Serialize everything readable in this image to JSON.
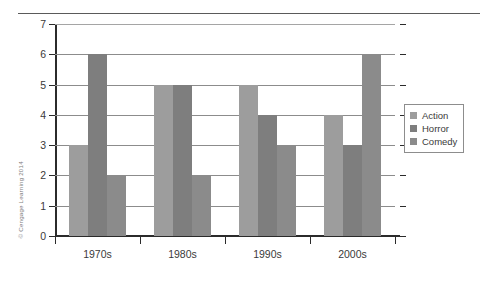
{
  "figure": {
    "credit": "© Cengage Learning 2014"
  },
  "chart_data": {
    "type": "bar",
    "title": "",
    "xlabel": "",
    "ylabel": "",
    "categories": [
      "1970s",
      "1980s",
      "1990s",
      "2000s"
    ],
    "series": [
      {
        "name": "Action",
        "color": "#9d9d9d",
        "values": [
          3,
          5,
          5,
          4
        ]
      },
      {
        "name": "Horror",
        "color": "#7e7e7e",
        "values": [
          6,
          5,
          4,
          3
        ]
      },
      {
        "name": "Comedy",
        "color": "#8b8b8b",
        "values": [
          2,
          2,
          3,
          6
        ]
      }
    ],
    "ylim": [
      0,
      7
    ],
    "yticks": [
      0,
      1,
      2,
      3,
      4,
      5,
      6,
      7
    ],
    "ytick_labels": [
      "0",
      "1",
      "2",
      "3",
      "4",
      "5",
      "6",
      "7"
    ],
    "grid": true,
    "legend_position": "right"
  },
  "legend": {
    "entries": [
      "Action",
      "Horror",
      "Comedy"
    ]
  }
}
